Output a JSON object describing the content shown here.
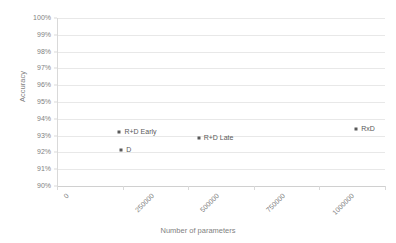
{
  "chart_data": {
    "type": "scatter",
    "title": "",
    "xlabel": "Number of parameters",
    "ylabel": "Accuracy",
    "xlim": [
      0,
      1250000
    ],
    "ylim": [
      0.9,
      1.0
    ],
    "grid": true,
    "legend": "none",
    "x_ticks": [
      "0",
      "250000",
      "500000",
      "750000",
      "1000000",
      "1250000"
    ],
    "x_tick_values": [
      0,
      250000,
      500000,
      750000,
      1000000,
      1250000
    ],
    "y_ticks": [
      "90%",
      "91%",
      "92%",
      "93%",
      "94%",
      "95%",
      "96%",
      "97%",
      "98%",
      "99%",
      "100%"
    ],
    "y_tick_values": [
      0.9,
      0.91,
      0.92,
      0.93,
      0.94,
      0.95,
      0.96,
      0.97,
      0.98,
      0.99,
      1.0
    ],
    "points": [
      {
        "label": "R+D Early",
        "x": 238000,
        "y": 0.932
      },
      {
        "label": "D",
        "x": 245000,
        "y": 0.9215
      },
      {
        "label": "R+D Late",
        "x": 540000,
        "y": 0.9285
      },
      {
        "label": "RxD",
        "x": 1140000,
        "y": 0.934
      }
    ],
    "marker_color": "#595959",
    "gridline_color": "#e8e8e8",
    "axis_color": "#d9d9d9",
    "text_color": "#7f7f7f",
    "background": "#ffffff"
  }
}
